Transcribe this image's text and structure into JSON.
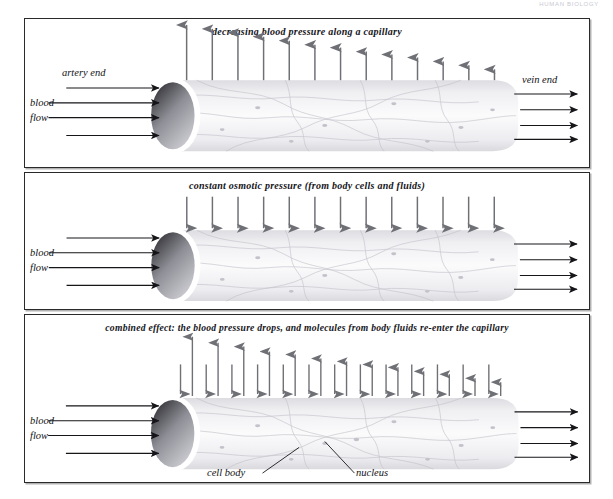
{
  "page_header": "HUMAN BIOLOGY",
  "figure": {
    "panels": [
      {
        "id": "panel-1",
        "caption": "decreasing blood pressure along a capillary",
        "labels": {
          "artery_end": "artery end",
          "blood": "blood",
          "flow": "flow",
          "vein_end": "vein end"
        },
        "arrows": {
          "outward_pressure": {
            "direction": "up",
            "count": 13,
            "meaning": "blood pressure pushing fluid out of capillary",
            "lengths": [
              58,
              54,
              50,
              46,
              42,
              38,
              35,
              31,
              28,
              25,
              21,
              17,
              13
            ]
          },
          "blood_flow_in": {
            "direction": "right",
            "count": 4
          },
          "blood_flow_out": {
            "direction": "right",
            "count": 4
          }
        }
      },
      {
        "id": "panel-2",
        "caption": "constant osmotic pressure (from body cells and fluids)",
        "labels": {
          "blood": "blood",
          "flow": "flow"
        },
        "arrows": {
          "inward_osmotic": {
            "direction": "down",
            "count": 13,
            "meaning": "constant osmotic pressure drawing fluid in",
            "lengths": [
              32,
              32,
              32,
              32,
              32,
              32,
              32,
              32,
              32,
              32,
              32,
              32,
              32
            ]
          },
          "blood_flow_in": {
            "direction": "right",
            "count": 4
          },
          "blood_flow_out": {
            "direction": "right",
            "count": 4
          }
        }
      },
      {
        "id": "panel-3",
        "caption": "combined effect: the blood pressure drops, and molecules from body fluids re-enter the capillary",
        "labels": {
          "blood": "blood",
          "flow": "flow",
          "cell_body": "cell body",
          "nucleus": "nucleus"
        },
        "arrows": {
          "outward_pressure": {
            "direction": "up",
            "count": 13,
            "lengths": [
              60,
              54,
              50,
              45,
              42,
              38,
              35,
              32,
              29,
              25,
              22,
              18,
              14
            ]
          },
          "inward_osmotic": {
            "direction": "down",
            "count": 13,
            "lengths": [
              30,
              30,
              30,
              30,
              30,
              30,
              30,
              30,
              30,
              30,
              30,
              30,
              30
            ]
          },
          "blood_flow_in": {
            "direction": "right",
            "count": 4
          },
          "blood_flow_out": {
            "direction": "right",
            "count": 4
          }
        }
      }
    ],
    "colors": {
      "arrow_gray": "#6f7076",
      "arrow_black": "#16161a",
      "panel_border": "#2a2a2a",
      "tube_fill": "#f2f2f4",
      "tube_line": "#b9b9c1",
      "opening_dark": "#3a3a40"
    }
  }
}
